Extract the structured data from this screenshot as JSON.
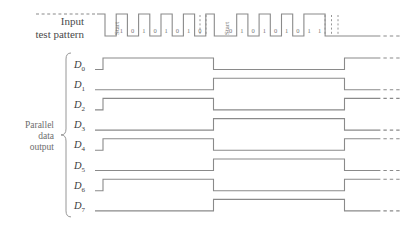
{
  "figure": {
    "stroke_color": "#8a8a8a",
    "text_color": "#4a4a4a"
  },
  "labels": {
    "input_line1": "Input",
    "input_line2": "test pattern",
    "parallel_line1": "Parallel",
    "parallel_line2": "data",
    "parallel_line3": "output",
    "start_bit": "Start"
  },
  "input_waveform": {
    "name": "input-test-pattern",
    "frames": [
      {
        "start_label": "Start",
        "bits": [
          "1",
          "0",
          "1",
          "0",
          "1",
          "0",
          "1",
          "0"
        ]
      },
      {
        "start_label": "Start",
        "bits": [
          "0",
          "1",
          "0",
          "1",
          "0",
          "1",
          "0",
          "1"
        ]
      }
    ],
    "trailing_bit": "1"
  },
  "chart_data": {
    "type": "line",
    "xlabel": "",
    "ylabel": "",
    "series": [
      {
        "name": "D0",
        "label": "D",
        "subscript": "0",
        "levels": [
          1,
          0,
          1
        ],
        "transitions": [
          213,
          344
        ]
      },
      {
        "name": "D1",
        "label": "D",
        "subscript": "1",
        "levels": [
          0,
          1,
          0
        ],
        "transitions": [
          213,
          344
        ]
      },
      {
        "name": "D2",
        "label": "D",
        "subscript": "2",
        "levels": [
          1,
          0,
          1
        ],
        "transitions": [
          213,
          344
        ]
      },
      {
        "name": "D3",
        "label": "D",
        "subscript": "3",
        "levels": [
          0,
          1,
          0
        ],
        "transitions": [
          213,
          344
        ]
      },
      {
        "name": "D4",
        "label": "D",
        "subscript": "4",
        "levels": [
          1,
          0,
          1
        ],
        "transitions": [
          213,
          344
        ]
      },
      {
        "name": "D5",
        "label": "D",
        "subscript": "5",
        "levels": [
          0,
          1,
          0
        ],
        "transitions": [
          213,
          344
        ]
      },
      {
        "name": "D6",
        "label": "D",
        "subscript": "6",
        "levels": [
          1,
          0,
          1
        ],
        "transitions": [
          213,
          344
        ]
      },
      {
        "name": "D7",
        "label": "D",
        "subscript": "7",
        "levels": [
          0,
          1,
          0
        ],
        "transitions": [
          213,
          344
        ]
      }
    ],
    "legend_position": "left",
    "grid": false
  },
  "signal_labels": [
    {
      "base": "D",
      "sub": "0"
    },
    {
      "base": "D",
      "sub": "1"
    },
    {
      "base": "D",
      "sub": "2"
    },
    {
      "base": "D",
      "sub": "3"
    },
    {
      "base": "D",
      "sub": "4"
    },
    {
      "base": "D",
      "sub": "5"
    },
    {
      "base": "D",
      "sub": "6"
    },
    {
      "base": "D",
      "sub": "7"
    }
  ]
}
